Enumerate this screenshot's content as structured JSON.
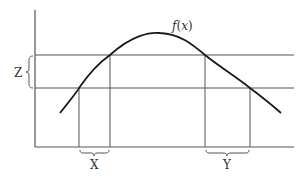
{
  "diagram": {
    "function_label": "f(x)",
    "function_label_parts": {
      "f": "f",
      "open": "(",
      "x": "x",
      "close": ")"
    },
    "labels": {
      "z": "Z",
      "x": "X",
      "y": "Y"
    },
    "colors": {
      "curve": "#1a1a1a",
      "lines": "#555555",
      "text": "#333333",
      "background": "#ffffff"
    }
  }
}
